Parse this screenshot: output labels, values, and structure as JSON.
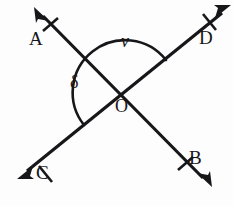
{
  "figure": {
    "type": "geometry-diagram",
    "background_color": "#fdfdfd",
    "stroke_color": "#17171a",
    "canvas": {
      "width": 233,
      "height": 206
    }
  },
  "points": {
    "intersection": {
      "name": "O",
      "label": "O",
      "x": 124,
      "y": 92
    },
    "A": {
      "name": "A",
      "label": "A",
      "x": 35,
      "y": 8,
      "role": "ray-endpoint-upper-left"
    },
    "B": {
      "name": "B",
      "label": "B",
      "x": 210,
      "y": 186,
      "role": "ray-endpoint-lower-right"
    },
    "C": {
      "name": "C",
      "label": "C",
      "x": 18,
      "y": 178,
      "role": "ray-endpoint-lower-left"
    },
    "D": {
      "name": "D",
      "label": "D",
      "x": 230,
      "y": 6,
      "role": "ray-endpoint-upper-right"
    }
  },
  "lines": [
    {
      "name": "line-CD",
      "from": "C",
      "through": "O",
      "to": "D",
      "arrowheads": [
        "C",
        "D"
      ],
      "tick_marks": 2
    },
    {
      "name": "line-AB",
      "from": "A",
      "through": "O",
      "to": "B",
      "arrowheads": [
        "A",
        "B"
      ],
      "tick_marks": 2
    }
  ],
  "angles": [
    {
      "name": "angle-nu",
      "label": "ν",
      "label_text": "v",
      "between_rays": [
        "OD",
        "OA"
      ],
      "position": "above-intersection",
      "arc": true
    },
    {
      "name": "angle-delta",
      "label": "δ",
      "label_text": "δ",
      "between_rays": [
        "OA",
        "OC"
      ],
      "position": "left-of-intersection",
      "arc": true
    }
  ],
  "labels": {
    "A": "A",
    "B": "B",
    "C": "C",
    "D": "D",
    "O": "O",
    "nu": "ν",
    "delta": "δ"
  }
}
